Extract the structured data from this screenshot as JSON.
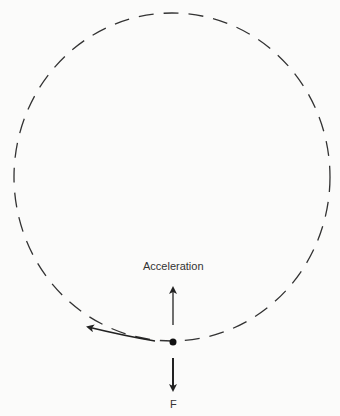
{
  "diagram": {
    "type": "circular-motion",
    "labels": {
      "acceleration": "Acceleration",
      "force": "F"
    },
    "colors": {
      "stroke": "#222222",
      "background": "#fbfbfa"
    },
    "path": {
      "shape": "dashed-circle",
      "cx": 172,
      "cy": 177,
      "rx": 158,
      "ry": 164
    },
    "object": {
      "x": 173,
      "y": 342
    },
    "velocity_direction": "counterclockwise (tangent left)"
  }
}
